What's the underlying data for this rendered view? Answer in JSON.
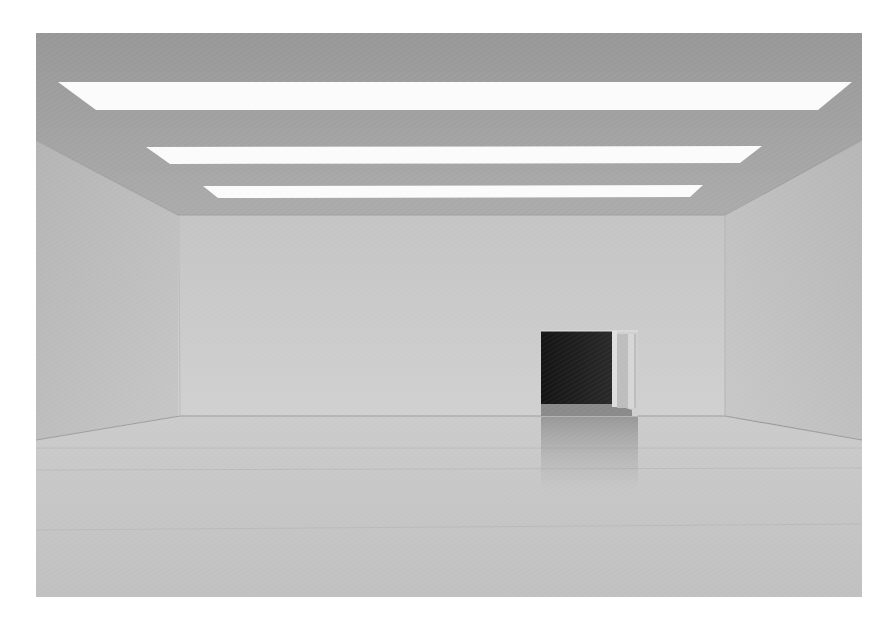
{
  "image": {
    "description": "Empty white gallery room with three skylight strips in the ceiling and an open doorway in the back wall",
    "alt": "Empty white gallery room"
  },
  "scene": {
    "colors": {
      "background": "#ffffff",
      "ceiling_top": "#9a9a9a",
      "ceiling_bottom": "#a9a9a9",
      "back_wall_top": "#c6c6c6",
      "back_wall_bottom": "#cfcfcf",
      "side_wall_top": "#b2b2b2",
      "side_wall_bottom": "#c4c4c4",
      "floor_far": "#c9c9c9",
      "floor_near": "#c2c2c2",
      "skylight": "#fbfbfb",
      "doorway_dark": "#1c1c1c",
      "doorway_inner_light": "#d8d8d8"
    },
    "skylights": [
      {
        "name": "skylight-1"
      },
      {
        "name": "skylight-2"
      },
      {
        "name": "skylight-3"
      }
    ],
    "doorway": {
      "name": "doorway"
    }
  }
}
